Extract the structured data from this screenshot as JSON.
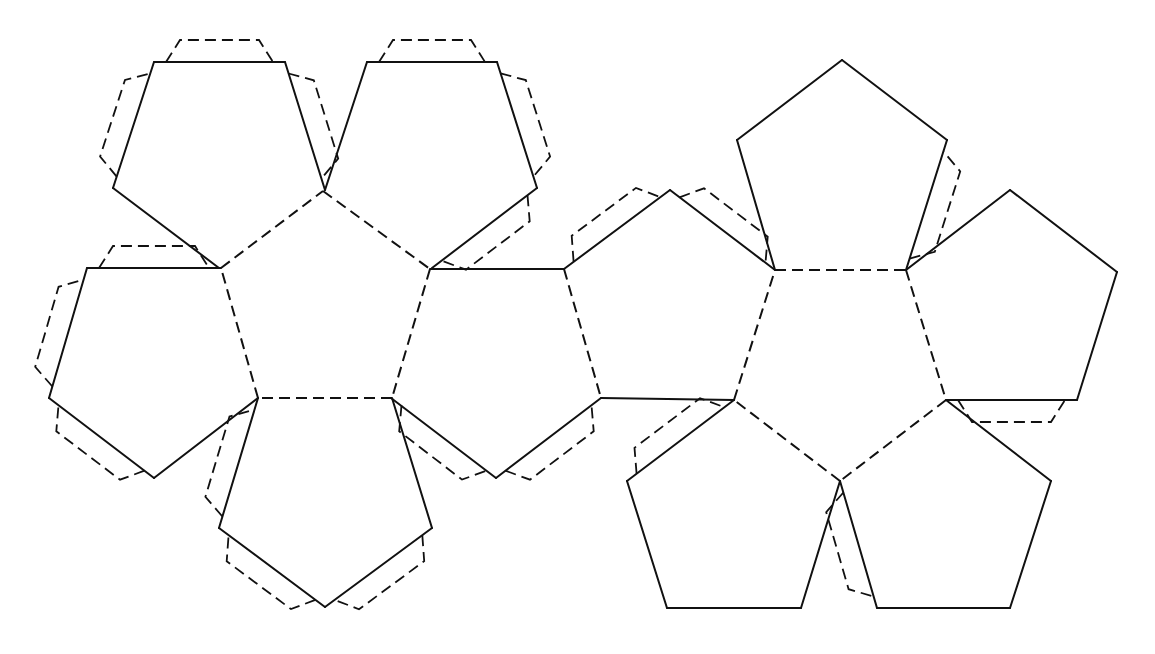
{
  "diagram": {
    "type": "dodecahedron-net",
    "stroke_color": "#111111",
    "background": "#ffffff",
    "faces": [
      {
        "id": "left-center",
        "points": [
          [
            323,
            191
          ],
          [
            430,
            269
          ],
          [
            392,
            398
          ],
          [
            258,
            398
          ],
          [
            221,
            268
          ]
        ]
      },
      {
        "id": "left-top-left",
        "points": [
          [
            154,
            62
          ],
          [
            285,
            62
          ],
          [
            325,
            190
          ],
          [
            219,
            268
          ],
          [
            113,
            188
          ]
        ]
      },
      {
        "id": "left-top-right",
        "points": [
          [
            367,
            62
          ],
          [
            497,
            62
          ],
          [
            537,
            188
          ],
          [
            432,
            268
          ],
          [
            325,
            190
          ]
        ]
      },
      {
        "id": "left-left",
        "points": [
          [
            87,
            268
          ],
          [
            221,
            268
          ],
          [
            258,
            398
          ],
          [
            154,
            478
          ],
          [
            49,
            398
          ]
        ]
      },
      {
        "id": "left-bottom",
        "points": [
          [
            258,
            398
          ],
          [
            392,
            398
          ],
          [
            432,
            528
          ],
          [
            325,
            607
          ],
          [
            219,
            528
          ]
        ]
      },
      {
        "id": "left-right",
        "points": [
          [
            430,
            269
          ],
          [
            564,
            269
          ],
          [
            601,
            398
          ],
          [
            496,
            478
          ],
          [
            391,
            398
          ]
        ]
      },
      {
        "id": "right-left",
        "points": [
          [
            564,
            269
          ],
          [
            670,
            190
          ],
          [
            775,
            270
          ],
          [
            734,
            400
          ],
          [
            601,
            398
          ]
        ]
      },
      {
        "id": "right-center",
        "points": [
          [
            775,
            270
          ],
          [
            906,
            270
          ],
          [
            946,
            400
          ],
          [
            840,
            481
          ],
          [
            734,
            400
          ]
        ]
      },
      {
        "id": "right-top",
        "points": [
          [
            775,
            270
          ],
          [
            737,
            140
          ],
          [
            842,
            60
          ],
          [
            947,
            140
          ],
          [
            906,
            270
          ]
        ]
      },
      {
        "id": "right-right",
        "points": [
          [
            906,
            270
          ],
          [
            1010,
            190
          ],
          [
            1117,
            272
          ],
          [
            1077,
            400
          ],
          [
            946,
            400
          ]
        ]
      },
      {
        "id": "right-bottom-left",
        "points": [
          [
            734,
            400
          ],
          [
            840,
            481
          ],
          [
            801,
            608
          ],
          [
            667,
            608
          ],
          [
            627,
            481
          ]
        ]
      },
      {
        "id": "right-bottom-right",
        "points": [
          [
            840,
            481
          ],
          [
            946,
            400
          ],
          [
            1051,
            481
          ],
          [
            1010,
            608
          ],
          [
            877,
            608
          ]
        ]
      }
    ],
    "fold_lines": [
      [
        [
          323,
          191
        ],
        [
          430,
          269
        ]
      ],
      [
        [
          430,
          269
        ],
        [
          392,
          398
        ]
      ],
      [
        [
          392,
          398
        ],
        [
          258,
          398
        ]
      ],
      [
        [
          258,
          398
        ],
        [
          221,
          268
        ]
      ],
      [
        [
          221,
          268
        ],
        [
          323,
          191
        ]
      ],
      [
        [
          564,
          269
        ],
        [
          601,
          398
        ]
      ],
      [
        [
          775,
          270
        ],
        [
          906,
          270
        ]
      ],
      [
        [
          906,
          270
        ],
        [
          946,
          400
        ]
      ],
      [
        [
          946,
          400
        ],
        [
          840,
          481
        ]
      ],
      [
        [
          840,
          481
        ],
        [
          734,
          400
        ]
      ],
      [
        [
          734,
          400
        ],
        [
          775,
          270
        ]
      ]
    ],
    "cut_lines": [
      [
        [
          154,
          62
        ],
        [
          285,
          62
        ]
      ],
      [
        [
          285,
          62
        ],
        [
          325,
          190
        ]
      ],
      [
        [
          219,
          268
        ],
        [
          113,
          188
        ]
      ],
      [
        [
          113,
          188
        ],
        [
          154,
          62
        ]
      ],
      [
        [
          367,
          62
        ],
        [
          497,
          62
        ]
      ],
      [
        [
          497,
          62
        ],
        [
          537,
          188
        ]
      ],
      [
        [
          537,
          188
        ],
        [
          432,
          268
        ]
      ],
      [
        [
          325,
          190
        ],
        [
          367,
          62
        ]
      ],
      [
        [
          87,
          268
        ],
        [
          221,
          268
        ]
      ],
      [
        [
          258,
          398
        ],
        [
          154,
          478
        ]
      ],
      [
        [
          154,
          478
        ],
        [
          49,
          398
        ]
      ],
      [
        [
          49,
          398
        ],
        [
          87,
          268
        ]
      ],
      [
        [
          392,
          398
        ],
        [
          432,
          528
        ]
      ],
      [
        [
          432,
          528
        ],
        [
          325,
          607
        ]
      ],
      [
        [
          325,
          607
        ],
        [
          219,
          528
        ]
      ],
      [
        [
          219,
          528
        ],
        [
          258,
          398
        ]
      ],
      [
        [
          430,
          269
        ],
        [
          564,
          269
        ]
      ],
      [
        [
          601,
          398
        ],
        [
          496,
          478
        ]
      ],
      [
        [
          496,
          478
        ],
        [
          391,
          398
        ]
      ],
      [
        [
          564,
          269
        ],
        [
          670,
          190
        ]
      ],
      [
        [
          670,
          190
        ],
        [
          775,
          270
        ]
      ],
      [
        [
          734,
          400
        ],
        [
          601,
          398
        ]
      ],
      [
        [
          775,
          270
        ],
        [
          737,
          140
        ]
      ],
      [
        [
          737,
          140
        ],
        [
          842,
          60
        ]
      ],
      [
        [
          842,
          60
        ],
        [
          947,
          140
        ]
      ],
      [
        [
          947,
          140
        ],
        [
          906,
          270
        ]
      ],
      [
        [
          906,
          270
        ],
        [
          1010,
          190
        ]
      ],
      [
        [
          1010,
          190
        ],
        [
          1117,
          272
        ]
      ],
      [
        [
          1117,
          272
        ],
        [
          1077,
          400
        ]
      ],
      [
        [
          1077,
          400
        ],
        [
          946,
          400
        ]
      ],
      [
        [
          840,
          481
        ],
        [
          801,
          608
        ]
      ],
      [
        [
          801,
          608
        ],
        [
          667,
          608
        ]
      ],
      [
        [
          667,
          608
        ],
        [
          627,
          481
        ]
      ],
      [
        [
          627,
          481
        ],
        [
          734,
          400
        ]
      ],
      [
        [
          946,
          400
        ],
        [
          1051,
          481
        ]
      ],
      [
        [
          1051,
          481
        ],
        [
          1010,
          608
        ]
      ],
      [
        [
          1010,
          608
        ],
        [
          877,
          608
        ]
      ],
      [
        [
          877,
          608
        ],
        [
          840,
          481
        ]
      ]
    ],
    "glue_tabs": [
      {
        "edge": [
          [
            154,
            62
          ],
          [
            285,
            62
          ]
        ],
        "center": [
          219,
          160
        ]
      },
      {
        "edge": [
          [
            113,
            188
          ],
          [
            154,
            62
          ]
        ],
        "center": [
          219,
          160
        ]
      },
      {
        "edge": [
          [
            285,
            62
          ],
          [
            325,
            190
          ]
        ],
        "center": [
          219,
          160
        ]
      },
      {
        "edge": [
          [
            367,
            62
          ],
          [
            497,
            62
          ]
        ],
        "center": [
          432,
          160
        ]
      },
      {
        "edge": [
          [
            497,
            62
          ],
          [
            537,
            188
          ]
        ],
        "center": [
          432,
          160
        ]
      },
      {
        "edge": [
          [
            537,
            188
          ],
          [
            432,
            268
          ]
        ],
        "center": [
          432,
          160
        ]
      },
      {
        "edge": [
          [
            87,
            268
          ],
          [
            221,
            268
          ]
        ],
        "center": [
          154,
          370
        ]
      },
      {
        "edge": [
          [
            49,
            398
          ],
          [
            87,
            268
          ]
        ],
        "center": [
          154,
          370
        ]
      },
      {
        "edge": [
          [
            154,
            478
          ],
          [
            49,
            398
          ]
        ],
        "center": [
          154,
          370
        ]
      },
      {
        "edge": [
          [
            219,
            528
          ],
          [
            258,
            398
          ]
        ],
        "center": [
          325,
          500
        ]
      },
      {
        "edge": [
          [
            325,
            607
          ],
          [
            219,
            528
          ]
        ],
        "center": [
          325,
          500
        ]
      },
      {
        "edge": [
          [
            432,
            528
          ],
          [
            325,
            607
          ]
        ],
        "center": [
          325,
          500
        ]
      },
      {
        "edge": [
          [
            392,
            398
          ],
          [
            496,
            478
          ]
        ],
        "center": [
          460,
          400
        ],
        "flip": true
      },
      {
        "edge": [
          [
            496,
            478
          ],
          [
            601,
            398
          ]
        ],
        "center": [
          496,
          370
        ]
      },
      {
        "edge": [
          [
            564,
            269
          ],
          [
            670,
            190
          ]
        ],
        "center": [
          670,
          300
        ],
        "flip": true
      },
      {
        "edge": [
          [
            670,
            190
          ],
          [
            775,
            270
          ]
        ],
        "center": [
          670,
          300
        ]
      },
      {
        "edge": [
          [
            906,
            270
          ],
          [
            947,
            140
          ]
        ],
        "center": [
          842,
          190
        ]
      },
      {
        "edge": [
          [
            946,
            400
          ],
          [
            1077,
            400
          ]
        ],
        "center": [
          1010,
          310
        ]
      },
      {
        "edge": [
          [
            627,
            481
          ],
          [
            734,
            400
          ]
        ],
        "center": [
          734,
          530
        ]
      },
      {
        "edge": [
          [
            840,
            481
          ],
          [
            877,
            608
          ]
        ],
        "center": [
          945,
          530
        ]
      }
    ]
  }
}
